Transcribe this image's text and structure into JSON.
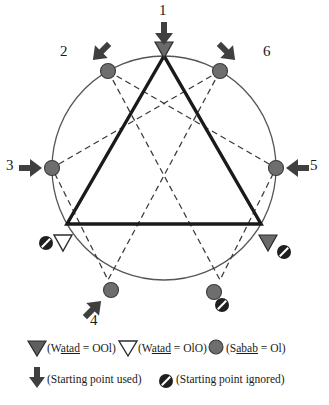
{
  "figure": {
    "colors": {
      "stroke_dark": "#2b2b2b",
      "marker_gray": "#6e6e6e",
      "circle_outline": "#555555",
      "dashed": "#3a3a3a",
      "background": "#ffffff",
      "white_fill": "#ffffff"
    },
    "circle": {
      "cx": 164,
      "cy": 168,
      "r": 112
    },
    "position_labels": [
      {
        "id": "pos-1",
        "text": "1",
        "x": 159,
        "y": 3
      },
      {
        "id": "pos-2",
        "text": "2",
        "x": 60,
        "y": 44
      },
      {
        "id": "pos-3",
        "text": "3",
        "x": 6,
        "y": 155
      },
      {
        "id": "pos-4",
        "text": "4",
        "x": 90,
        "y": 317
      },
      {
        "id": "pos-5",
        "text": "5",
        "x": 309,
        "y": 155
      },
      {
        "id": "pos-6",
        "text": "6",
        "x": 262,
        "y": 44
      }
    ],
    "markers": [
      {
        "id": "marker-1",
        "kind": "watad-filled-triangle",
        "note": "top vertex, starting point used"
      },
      {
        "id": "marker-2",
        "kind": "sabab-circle",
        "note": "upper-left, starting point used"
      },
      {
        "id": "marker-3",
        "kind": "sabab-circle",
        "note": "left, starting point used"
      },
      {
        "id": "marker-4",
        "kind": "sabab-circle",
        "note": "lower-left, starting point used"
      },
      {
        "id": "marker-5",
        "kind": "sabab-circle",
        "note": "right, starting point used"
      },
      {
        "id": "marker-6",
        "kind": "sabab-circle",
        "note": "upper-right, starting point used"
      },
      {
        "id": "marker-bl",
        "kind": "watad-hollow-triangle",
        "note": "bottom-left vertex, starting point ignored"
      },
      {
        "id": "marker-br",
        "kind": "watad-filled-triangle",
        "note": "bottom-right vertex, starting point ignored"
      },
      {
        "id": "marker-bc",
        "kind": "sabab-circle",
        "note": "bottom-center, starting point ignored"
      }
    ]
  },
  "legend": {
    "row1": [
      {
        "id": "legend-watad-ool",
        "icon": "filled-down-triangle-icon",
        "open_paren": "(",
        "prefix": "W",
        "underlined": "atad",
        "suffix": " = OOl)",
        "full_text": "(Watad = OOl)"
      },
      {
        "id": "legend-watad-olo",
        "icon": "hollow-down-triangle-icon",
        "open_paren": "(",
        "prefix": "W",
        "underlined": "atad",
        "suffix": " = OlO)",
        "full_text": "(Watad = OlO)"
      },
      {
        "id": "legend-sabab-ol",
        "icon": "gray-circle-icon",
        "open_paren": "(",
        "prefix": "S",
        "underlined": "abab",
        "suffix": " = Ol)",
        "full_text": "(Sabab = Ol)"
      }
    ],
    "row2": [
      {
        "id": "legend-start-used",
        "icon": "down-arrow-icon",
        "text": "(Starting point used)"
      },
      {
        "id": "legend-start-ignored",
        "icon": "prohibition-icon",
        "text": "(Starting point ignored)"
      }
    ]
  }
}
